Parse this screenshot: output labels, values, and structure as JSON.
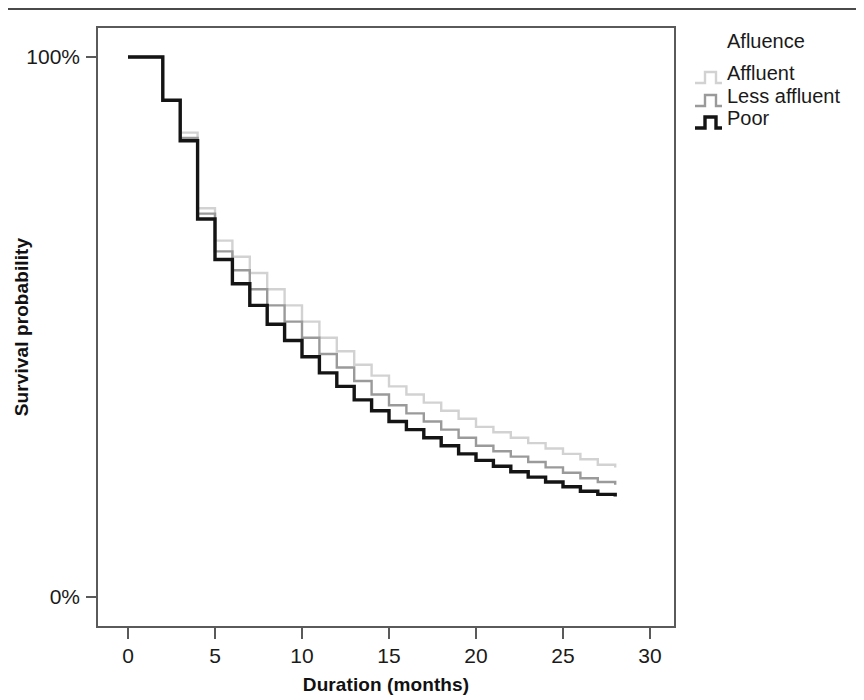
{
  "figure": {
    "has_top_rule": true,
    "background": "#ffffff"
  },
  "axes": {
    "x_title": "Duration (months)",
    "y_title": "Survival probability",
    "x_ticks": [
      "0",
      "5",
      "10",
      "15",
      "20",
      "25",
      "30"
    ],
    "y_ticks": [
      "100%",
      "0%"
    ]
  },
  "legend": {
    "title": "Afluence",
    "items": [
      {
        "label": "Affluent",
        "color": "#d2d2d2"
      },
      {
        "label": "Less affluent",
        "color": "#9a9a9a"
      },
      {
        "label": "Poor",
        "color": "#141414"
      }
    ]
  },
  "chart_data": {
    "type": "line",
    "title": "",
    "subtitle": "",
    "xlabel": "Duration (months)",
    "ylabel": "Survival probability",
    "xlim": [
      0,
      30
    ],
    "ylim": [
      0,
      100
    ],
    "x_ticks": [
      0,
      5,
      10,
      15,
      20,
      25,
      30
    ],
    "y_ticks": [
      0,
      100
    ],
    "y_tick_labels": [
      "0%",
      "100%"
    ],
    "grid": false,
    "legend_position": "top-right",
    "legend_title": "Afluence",
    "step_style": "post",
    "units": {
      "x": "months",
      "y": "percent"
    },
    "series": [
      {
        "name": "Affluent",
        "color": "#d2d2d2",
        "x": [
          0,
          1,
          2,
          3,
          4,
          5,
          6,
          7,
          8,
          9,
          10,
          11,
          12,
          13,
          14,
          15,
          16,
          17,
          18,
          19,
          20,
          21,
          22,
          23,
          24,
          25,
          26,
          27,
          28
        ],
        "values": [
          100,
          100,
          92,
          86,
          72,
          66,
          63,
          60,
          57,
          54,
          51,
          48,
          45.5,
          43,
          41,
          39,
          37.5,
          36,
          34.5,
          33,
          31.5,
          30.5,
          29.5,
          28.5,
          27.5,
          26.5,
          25.5,
          24.5,
          24
        ]
      },
      {
        "name": "Less affluent",
        "color": "#9a9a9a",
        "x": [
          0,
          1,
          2,
          3,
          4,
          5,
          6,
          7,
          8,
          9,
          10,
          11,
          12,
          13,
          14,
          15,
          16,
          17,
          18,
          19,
          20,
          21,
          22,
          23,
          24,
          25,
          26,
          27,
          28
        ],
        "values": [
          100,
          100,
          92,
          85,
          71,
          64,
          60.5,
          57,
          54,
          51,
          48,
          45,
          42.5,
          40,
          37.5,
          35.5,
          34,
          32.5,
          31,
          29.5,
          28,
          27,
          26,
          25,
          24,
          23,
          22,
          21.3,
          20.8
        ]
      },
      {
        "name": "Poor",
        "color": "#141414",
        "x": [
          0,
          1,
          2,
          3,
          4,
          5,
          6,
          7,
          8,
          9,
          10,
          11,
          12,
          13,
          14,
          15,
          16,
          17,
          18,
          19,
          20,
          21,
          22,
          23,
          24,
          25,
          26,
          27,
          28
        ],
        "values": [
          100,
          100,
          92,
          84.5,
          70,
          62.5,
          58,
          54,
          50.5,
          47.5,
          44.5,
          41.5,
          39,
          36.5,
          34.5,
          32.5,
          31,
          29.5,
          28,
          26.5,
          25.3,
          24.2,
          23.2,
          22.2,
          21.3,
          20.4,
          19.6,
          19,
          18.6
        ]
      }
    ]
  }
}
